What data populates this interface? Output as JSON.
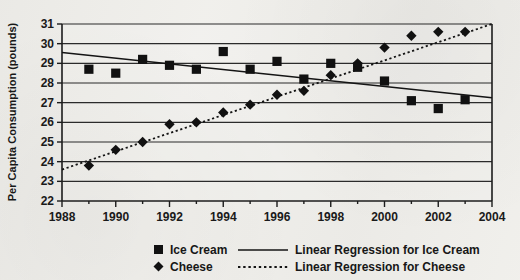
{
  "chart_data": {
    "type": "scatter",
    "title": "",
    "xlabel": "",
    "ylabel": "Per Capita Consumption (pounds)",
    "xlim": [
      1988,
      2004
    ],
    "ylim": [
      22,
      31
    ],
    "xticks": [
      1988,
      1990,
      1992,
      1994,
      1996,
      1998,
      2000,
      2002,
      2004
    ],
    "yticks": [
      22,
      23,
      24,
      25,
      26,
      27,
      28,
      29,
      30,
      31
    ],
    "x_minor_ticks": [
      1989,
      1991,
      1993,
      1995,
      1997,
      1999,
      2001,
      2003
    ],
    "grid": "horizontal",
    "legend_position": "bottom",
    "x": [
      1989,
      1990,
      1991,
      1992,
      1993,
      1994,
      1995,
      1996,
      1997,
      1998,
      1999,
      2000,
      2001,
      2002,
      2003
    ],
    "series": [
      {
        "name": "Ice Cream",
        "marker": "square",
        "values": [
          28.7,
          28.5,
          29.2,
          28.9,
          28.7,
          29.6,
          28.7,
          29.1,
          28.2,
          29.0,
          28.8,
          28.1,
          27.1,
          26.7,
          27.15
        ]
      },
      {
        "name": "Cheese",
        "marker": "diamond",
        "values": [
          23.8,
          24.6,
          25.0,
          25.9,
          26.0,
          26.5,
          26.9,
          27.4,
          27.6,
          28.4,
          29.0,
          29.8,
          30.4,
          30.6,
          30.6
        ]
      }
    ],
    "trendlines": [
      {
        "name": "Linear Regression for Ice Cream",
        "style": "solid",
        "x_start": 1988,
        "y_start": 29.55,
        "x_end": 2004,
        "y_end": 27.25
      },
      {
        "name": "Linear Regression for Cheese",
        "style": "dotted",
        "x_start": 1988,
        "y_start": 23.6,
        "x_end": 2004,
        "y_end": 31.0
      }
    ]
  },
  "axes": {
    "y_title": "Per Capita Consumption (pounds)",
    "y_tick_labels": [
      "31",
      "30",
      "29",
      "28",
      "27",
      "26",
      "25",
      "24",
      "23",
      "22"
    ],
    "x_tick_labels": [
      "1988",
      "1990",
      "1992",
      "1994",
      "1996",
      "1998",
      "2000",
      "2002",
      "2004"
    ]
  },
  "legend": {
    "entries": [
      {
        "label": "Ice Cream",
        "swatch": "square-marker",
        "swatch_name": "ice-cream-square-swatch"
      },
      {
        "label": "Linear Regression for Ice Cream",
        "swatch": "solid-line",
        "swatch_name": "ice-cream-solid-line-swatch"
      },
      {
        "label": "Cheese",
        "swatch": "diamond-marker",
        "swatch_name": "cheese-diamond-swatch"
      },
      {
        "label": "Linear Regression for Cheese",
        "swatch": "dotted-line",
        "swatch_name": "cheese-dotted-line-swatch"
      }
    ]
  },
  "colors": {
    "ink": "#111111",
    "grid": "#2b2b2b",
    "background": "#f0efeb"
  }
}
